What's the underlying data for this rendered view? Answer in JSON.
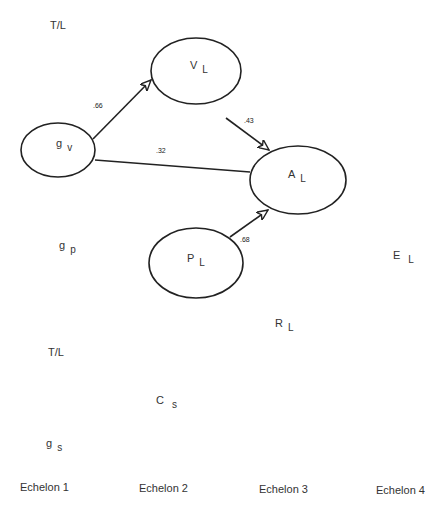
{
  "diagram": {
    "nodes": [
      {
        "id": "gv",
        "main": "g",
        "sub": "v",
        "shape": "ellipse"
      },
      {
        "id": "VL",
        "main": "V",
        "sub": "L",
        "shape": "ellipse"
      },
      {
        "id": "AL",
        "main": "A",
        "sub": "L",
        "shape": "ellipse"
      },
      {
        "id": "PL",
        "main": "P",
        "sub": "L",
        "shape": "ellipse"
      }
    ],
    "labels": [
      {
        "id": "tl_top",
        "text": "T/L"
      },
      {
        "id": "gp",
        "main": "g",
        "sub": "p"
      },
      {
        "id": "EL",
        "main": "E",
        "sub": "L"
      },
      {
        "id": "RL",
        "main": "R",
        "sub": "L"
      },
      {
        "id": "tl_bottom",
        "text": "T/L"
      },
      {
        "id": "Cs",
        "main": "C",
        "sub": "s"
      },
      {
        "id": "gs",
        "main": "g",
        "sub": "s"
      }
    ],
    "edges": [
      {
        "from": "gv",
        "to": "VL",
        "coef": ".66",
        "arrow": true
      },
      {
        "from": "VL",
        "to": "AL",
        "coef": ".43",
        "arrow": true
      },
      {
        "from": "gv",
        "to": "AL",
        "coef": ".32",
        "arrow": false
      },
      {
        "from": "PL",
        "to": "AL",
        "coef": ".68",
        "arrow": true
      }
    ],
    "echelons": [
      "Echelon 1",
      "Echelon 2",
      "Echelon 3",
      "Echelon 4"
    ]
  }
}
